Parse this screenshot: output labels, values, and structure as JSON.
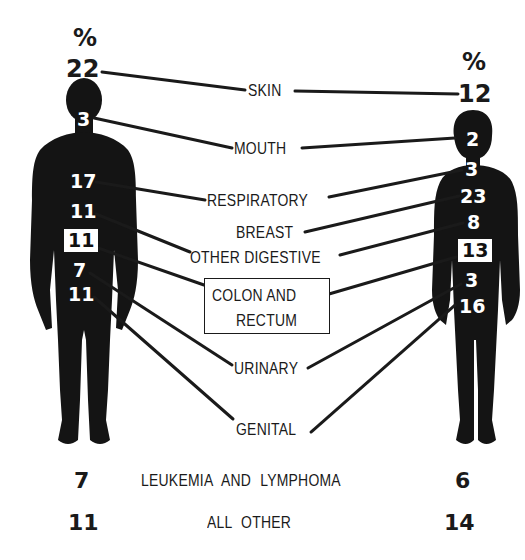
{
  "diagram": {
    "title_marker": "%",
    "male": {
      "skin": "22",
      "mouth": "3",
      "respiratory": "17",
      "other_digestive": "11",
      "colon_and_rectum": "11",
      "urinary": "7",
      "genital": "11",
      "leukemia_and_lymphoma": "7",
      "all_other": "11"
    },
    "female": {
      "skin": "12",
      "mouth": "2",
      "respiratory": "3",
      "breast": "23",
      "other_digestive": "8",
      "colon_and_rectum": "13",
      "urinary": "3",
      "genital": "16",
      "leukemia_and_lymphoma": "6",
      "all_other": "14"
    },
    "labels": {
      "skin": "SKIN",
      "mouth": "MOUTH",
      "respiratory": "RESPIRATORY",
      "breast": "BREAST",
      "other_digestive": "OTHER DIGESTIVE",
      "colon_line1": "COLON AND",
      "colon_line2": "RECTUM",
      "urinary": "URINARY",
      "genital": "GENITAL",
      "leukemia_and_lymphoma": "LEUKEMIA AND LYMPHOMA",
      "all_other": "ALL OTHER"
    },
    "colors": {
      "ink": "#1a1a1a",
      "paper": "#ffffff"
    }
  }
}
